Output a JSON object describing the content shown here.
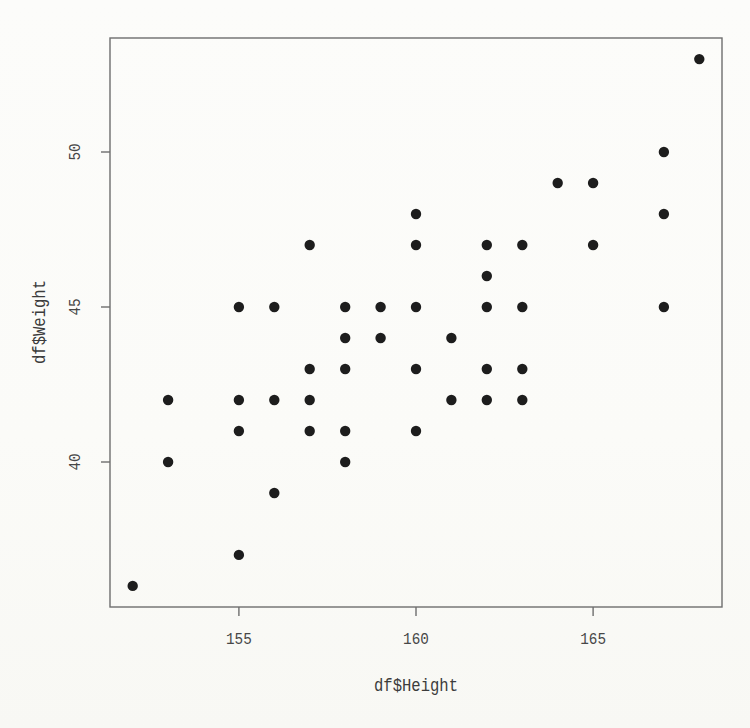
{
  "chart_data": {
    "type": "scatter",
    "title": "",
    "xlabel": "df$Height",
    "ylabel": "df$Weight",
    "x_ticks": [
      155,
      160,
      165
    ],
    "y_ticks": [
      40,
      45,
      50
    ],
    "xlim": [
      151.36,
      168.64
    ],
    "ylim": [
      35.32,
      53.68
    ],
    "grid": false,
    "legend": "none",
    "marker": "filled-circle",
    "colors": {
      "point": "#1d1d1d",
      "axis": "#6e6e6e",
      "tick_label": "#474747",
      "axis_title": "#3c3c3c",
      "background": "#fbfbf8"
    },
    "points": [
      {
        "x": 152,
        "y": 36
      },
      {
        "x": 153,
        "y": 40
      },
      {
        "x": 153,
        "y": 42
      },
      {
        "x": 155,
        "y": 37
      },
      {
        "x": 155,
        "y": 41
      },
      {
        "x": 155,
        "y": 42
      },
      {
        "x": 155,
        "y": 45
      },
      {
        "x": 156,
        "y": 39
      },
      {
        "x": 156,
        "y": 42
      },
      {
        "x": 156,
        "y": 45
      },
      {
        "x": 157,
        "y": 41
      },
      {
        "x": 157,
        "y": 42
      },
      {
        "x": 157,
        "y": 43
      },
      {
        "x": 157,
        "y": 47
      },
      {
        "x": 158,
        "y": 40
      },
      {
        "x": 158,
        "y": 41
      },
      {
        "x": 158,
        "y": 43
      },
      {
        "x": 158,
        "y": 44
      },
      {
        "x": 158,
        "y": 45
      },
      {
        "x": 159,
        "y": 44
      },
      {
        "x": 159,
        "y": 45
      },
      {
        "x": 160,
        "y": 41
      },
      {
        "x": 160,
        "y": 43
      },
      {
        "x": 160,
        "y": 45
      },
      {
        "x": 160,
        "y": 47
      },
      {
        "x": 160,
        "y": 48
      },
      {
        "x": 161,
        "y": 42
      },
      {
        "x": 161,
        "y": 44
      },
      {
        "x": 162,
        "y": 42
      },
      {
        "x": 162,
        "y": 43
      },
      {
        "x": 162,
        "y": 45
      },
      {
        "x": 162,
        "y": 46
      },
      {
        "x": 162,
        "y": 47
      },
      {
        "x": 163,
        "y": 42
      },
      {
        "x": 163,
        "y": 43
      },
      {
        "x": 163,
        "y": 45
      },
      {
        "x": 163,
        "y": 47
      },
      {
        "x": 164,
        "y": 49
      },
      {
        "x": 165,
        "y": 47
      },
      {
        "x": 165,
        "y": 49
      },
      {
        "x": 167,
        "y": 45
      },
      {
        "x": 167,
        "y": 48
      },
      {
        "x": 167,
        "y": 50
      },
      {
        "x": 168,
        "y": 53
      }
    ]
  }
}
